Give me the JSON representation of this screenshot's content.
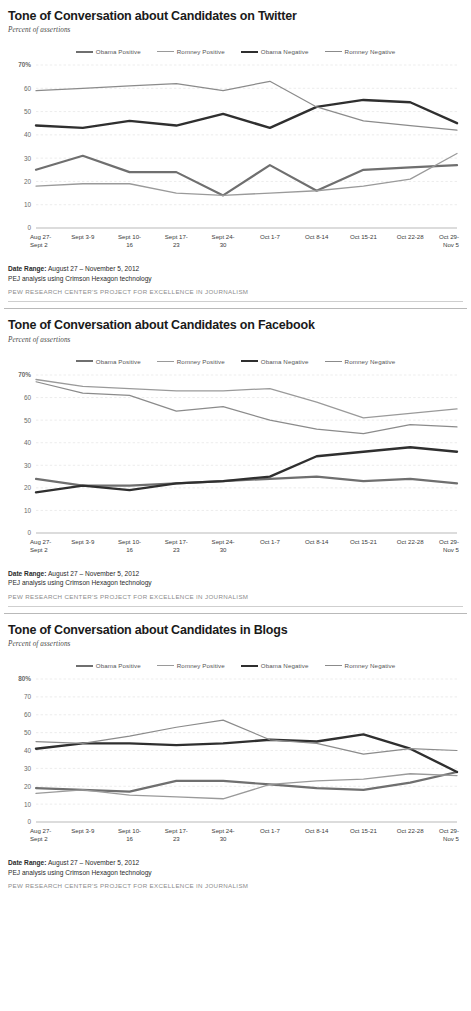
{
  "page": {
    "background": "#ffffff",
    "attribution": "PEW RESEARCH CENTER'S PROJECT FOR EXCELLENCE IN JOURNALISM",
    "date_range_label": "Date Range:",
    "date_range_value": "August 27 – November 5, 2012",
    "methodology": "PEJ analysis using Crimson Hexagon technology",
    "subtitle": "Percent of assertions"
  },
  "series_colors": {
    "obama_positive": "#6f6f6f",
    "romney_positive": "#9a9a9a",
    "obama_negative": "#2f2f2f",
    "romney_negative": "#8b8b8b"
  },
  "legend": {
    "items": [
      {
        "label": "Obama Positive",
        "key": "obama_positive",
        "color": "#6f6f6f",
        "width": 2.2
      },
      {
        "label": "Romney Positive",
        "key": "romney_positive",
        "color": "#9a9a9a",
        "width": 1.5
      },
      {
        "label": "Obama Negative",
        "key": "obama_negative",
        "color": "#2f2f2f",
        "width": 2.4
      },
      {
        "label": "Romney Negative",
        "key": "romney_negative",
        "color": "#8b8b8b",
        "width": 1.3
      }
    ]
  },
  "x_categories": [
    "Aug 27-\nSept 2",
    "Sept 3-9",
    "Sept 10-\n16",
    "Sept 17-\n23",
    "Sept 24-\n30",
    "Oct 1-7",
    "Oct 8-14",
    "Oct 15-21",
    "Oct 22-28",
    "Oct 29-\nNov 5"
  ],
  "charts": [
    {
      "id": "twitter",
      "title": "Tone of Conversation about Candidates on Twitter",
      "chart_data": {
        "type": "line",
        "title": "Tone of Conversation about Candidates on Twitter",
        "subtitle": "Percent of assertions",
        "xlabel": "",
        "ylabel": "Percent of assertions",
        "ylim": [
          0,
          70
        ],
        "yticks": [
          0,
          10,
          20,
          30,
          40,
          50,
          60,
          70
        ],
        "ytick_labels": [
          "0",
          "10",
          "20",
          "30",
          "40",
          "50",
          "60",
          "70%"
        ],
        "grid": true,
        "legend_position": "top-center",
        "categories": [
          "Aug 27-Sept 2",
          "Sept 3-9",
          "Sept 10-16",
          "Sept 17-23",
          "Sept 24-30",
          "Oct 1-7",
          "Oct 8-14",
          "Oct 15-21",
          "Oct 22-28",
          "Oct 29-Nov 5"
        ],
        "series": [
          {
            "name": "Obama Positive",
            "color": "#6f6f6f",
            "values": [
              25,
              31,
              24,
              24,
              14,
              27,
              16,
              25,
              26,
              27
            ]
          },
          {
            "name": "Romney Positive",
            "color": "#9a9a9a",
            "values": [
              18,
              19,
              19,
              15,
              14,
              15,
              16,
              18,
              21,
              32
            ]
          },
          {
            "name": "Obama Negative",
            "color": "#2f2f2f",
            "values": [
              44,
              43,
              46,
              44,
              49,
              43,
              52,
              55,
              54,
              45
            ]
          },
          {
            "name": "Romney Negative",
            "color": "#8b8b8b",
            "values": [
              59,
              60,
              61,
              62,
              59,
              63,
              52,
              46,
              44,
              42
            ]
          }
        ]
      }
    },
    {
      "id": "facebook",
      "title": "Tone of Conversation about Candidates on Facebook",
      "chart_data": {
        "type": "line",
        "title": "Tone of Conversation about Candidates on Facebook",
        "subtitle": "Percent of assertions",
        "xlabel": "",
        "ylabel": "Percent of assertions",
        "ylim": [
          0,
          70
        ],
        "yticks": [
          0,
          10,
          20,
          30,
          40,
          50,
          60,
          70
        ],
        "ytick_labels": [
          "0",
          "10",
          "20",
          "30",
          "40",
          "50",
          "60",
          "70%"
        ],
        "grid": true,
        "legend_position": "top-center",
        "categories": [
          "Aug 27-Sept 2",
          "Sept 3-9",
          "Sept 10-16",
          "Sept 17-23",
          "Sept 24-30",
          "Oct 1-7",
          "Oct 8-14",
          "Oct 15-21",
          "Oct 22-28",
          "Oct 29-Nov 5"
        ],
        "series": [
          {
            "name": "Obama Positive",
            "color": "#6f6f6f",
            "values": [
              24,
              21,
              21,
              22,
              23,
              24,
              25,
              23,
              24,
              22
            ]
          },
          {
            "name": "Romney Positive",
            "color": "#9a9a9a",
            "values": [
              68,
              65,
              64,
              63,
              63,
              64,
              58,
              51,
              53,
              55
            ]
          },
          {
            "name": "Obama Negative",
            "color": "#2f2f2f",
            "values": [
              18,
              21,
              19,
              22,
              23,
              25,
              34,
              36,
              38,
              36
            ]
          },
          {
            "name": "Romney Negative",
            "color": "#8b8b8b",
            "values": [
              67,
              62,
              61,
              54,
              56,
              50,
              46,
              44,
              48,
              47
            ]
          }
        ]
      }
    },
    {
      "id": "blogs",
      "title": "Tone of Conversation about Candidates in Blogs",
      "chart_data": {
        "type": "line",
        "title": "Tone of Conversation about Candidates in Blogs",
        "subtitle": "Percent of assertions",
        "xlabel": "",
        "ylabel": "Percent of assertions",
        "ylim": [
          0,
          80
        ],
        "yticks": [
          0,
          10,
          20,
          30,
          40,
          50,
          60,
          70,
          80
        ],
        "ytick_labels": [
          "0",
          "10",
          "20",
          "30",
          "40",
          "50",
          "60",
          "70",
          "80%"
        ],
        "grid": true,
        "legend_position": "top-center",
        "categories": [
          "Aug 27-Sept 2",
          "Sept 3-9",
          "Sept 10-16",
          "Sept 17-23",
          "Sept 24-30",
          "Oct 1-7",
          "Oct 8-14",
          "Oct 15-21",
          "Oct 22-28",
          "Oct 29-Nov 5"
        ],
        "series": [
          {
            "name": "Obama Positive",
            "color": "#6f6f6f",
            "values": [
              19,
              18,
              17,
              23,
              23,
              21,
              19,
              18,
              22,
              28
            ]
          },
          {
            "name": "Romney Positive",
            "color": "#9a9a9a",
            "values": [
              16,
              18,
              15,
              14,
              13,
              21,
              23,
              24,
              27,
              26
            ]
          },
          {
            "name": "Obama Negative",
            "color": "#2f2f2f",
            "values": [
              41,
              44,
              44,
              43,
              44,
              46,
              45,
              49,
              41,
              28
            ]
          },
          {
            "name": "Romney Negative",
            "color": "#8b8b8b",
            "values": [
              45,
              44,
              48,
              53,
              57,
              46,
              44,
              38,
              41,
              40
            ]
          }
        ]
      }
    }
  ]
}
